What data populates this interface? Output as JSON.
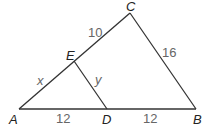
{
  "diagram": {
    "type": "triangle-with-segment",
    "colors": {
      "line": "#333333",
      "vertex_label": "#222222",
      "measure_label": "#666666"
    },
    "vertices": {
      "A": {
        "label": "A",
        "x": 19,
        "y": 109
      },
      "B": {
        "label": "B",
        "x": 196,
        "y": 109
      },
      "C": {
        "label": "C",
        "x": 130,
        "y": 13
      },
      "D": {
        "label": "D",
        "x": 107,
        "y": 109
      },
      "E": {
        "label": "E",
        "x": 74,
        "y": 61
      }
    },
    "segments": [
      {
        "from": "A",
        "to": "B"
      },
      {
        "from": "A",
        "to": "C"
      },
      {
        "from": "C",
        "to": "B"
      },
      {
        "from": "E",
        "to": "D"
      }
    ],
    "measures": {
      "EC": "10",
      "CB": "16",
      "AE": "x",
      "ED": "y",
      "AD": "12",
      "DB": "12"
    }
  }
}
